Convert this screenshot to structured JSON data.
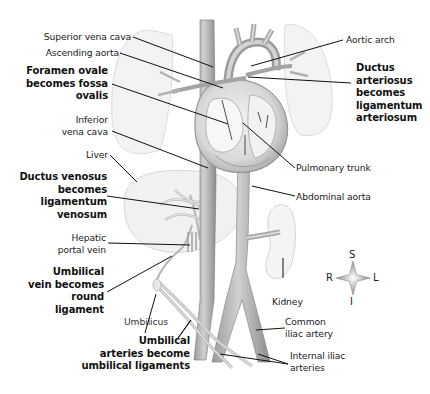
{
  "diagram": {
    "type": "anatomical-illustration",
    "labels_left": [
      {
        "id": "superior-vena-cava",
        "text": "Superior vena cava",
        "bold": false
      },
      {
        "id": "ascending-aorta",
        "text": "Ascending aorta",
        "bold": false
      },
      {
        "id": "foramen-ovale",
        "lines": [
          "Foramen ovale",
          "becomes fossa",
          "ovalis"
        ],
        "bold": true
      },
      {
        "id": "inferior-vena-cava",
        "lines": [
          "Inferior",
          "vena cava"
        ],
        "bold": false
      },
      {
        "id": "liver",
        "text": "Liver",
        "bold": false
      },
      {
        "id": "ductus-venosus",
        "lines": [
          "Ductus venosus",
          "becomes",
          "ligamentum",
          "venosum"
        ],
        "bold": true
      },
      {
        "id": "hepatic-portal-vein",
        "lines": [
          "Hepatic",
          "portal vein"
        ],
        "bold": false
      },
      {
        "id": "umbilical-vein",
        "lines": [
          "Umbilical",
          "vein becomes",
          "round",
          "ligament"
        ],
        "bold": true
      },
      {
        "id": "umbilicus",
        "text": "Umbilicus",
        "bold": false
      },
      {
        "id": "umbilical-arteries",
        "lines": [
          "Umbilical",
          "arteries become",
          "umbilical ligaments"
        ],
        "bold": true
      }
    ],
    "labels_right": [
      {
        "id": "aortic-arch",
        "text": "Aortic arch",
        "bold": false
      },
      {
        "id": "ductus-arteriosus",
        "lines": [
          "Ductus",
          "arteriosus",
          "becomes",
          "ligamentum",
          "arteriosum"
        ],
        "bold": true
      },
      {
        "id": "pulmonary-trunk",
        "text": "Pulmonary trunk",
        "bold": false
      },
      {
        "id": "abdominal-aorta",
        "text": "Abdominal aorta",
        "bold": false
      },
      {
        "id": "kidney",
        "text": "Kidney",
        "bold": false
      },
      {
        "id": "common-iliac-artery",
        "lines": [
          "Common",
          "iliac artery"
        ],
        "bold": false
      },
      {
        "id": "internal-iliac-arteries",
        "lines": [
          "Internal iliac",
          "arteries"
        ],
        "bold": false
      }
    ],
    "compass": {
      "superior": "S",
      "inferior": "I",
      "right": "R",
      "left": "L"
    },
    "colors": {
      "vessel_fill": "#b8b8b8",
      "vessel_dark": "#8a8a8a",
      "organ_fill": "#f2f2f2",
      "organ_stroke": "#d6d6d6",
      "leader_line": "#111111",
      "text": "#1a1a1a"
    }
  }
}
